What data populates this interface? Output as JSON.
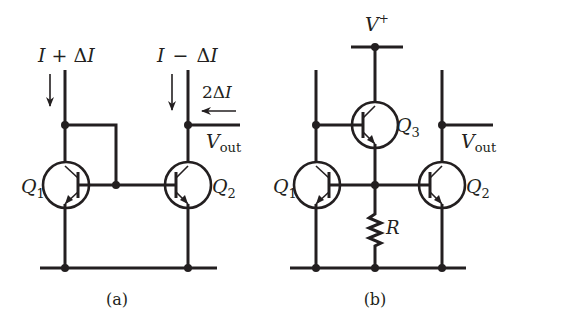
{
  "figure": {
    "panel_a": {
      "caption": "(a)",
      "current_left": {
        "I": "I",
        "op": "+",
        "delta": "Δ",
        "I2": "I"
      },
      "current_right": {
        "I": "I",
        "op": "−",
        "delta": "Δ",
        "I2": "I"
      },
      "output_current": {
        "coef": "2",
        "delta": "Δ",
        "I": "I"
      },
      "vout": {
        "V": "V",
        "sub": "out"
      },
      "q1": {
        "Q": "Q",
        "sub": "1"
      },
      "q2": {
        "Q": "Q",
        "sub": "2"
      }
    },
    "panel_b": {
      "caption": "(b)",
      "supply": {
        "V": "V",
        "sup": "+"
      },
      "vout": {
        "V": "V",
        "sub": "out"
      },
      "q1": {
        "Q": "Q",
        "sub": "1"
      },
      "q2": {
        "Q": "Q",
        "sub": "2"
      },
      "q3": {
        "Q": "Q",
        "sub": "3"
      },
      "resistor": "R"
    },
    "colors": {
      "ink": "#231f20",
      "background": "#ffffff"
    }
  }
}
